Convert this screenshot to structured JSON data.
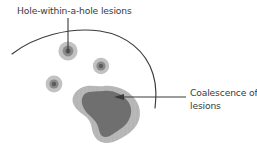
{
  "figure": {
    "background_color": "#ffffff",
    "line_color": "#3a3a3a",
    "labels": {
      "hole_within_hole": "Hole-within-a-hole lesions",
      "coalescence_line1": "Coalescence of",
      "coalescence_line2": "lesions"
    },
    "colors": {
      "lesion_outer": "#b8b8b8",
      "lesion_inner": "#7d7d7d",
      "lesion_core": "#5c5c5c",
      "blob_outer": "#b5b5b5",
      "blob_inner": "#6f6f6f",
      "stroke": "#3a3a3a",
      "text": "#3a3a3a"
    },
    "elements": {
      "bone_arc_name": "bone-cortex-arc",
      "small_lesions": [
        {
          "name": "lesion-upper-left",
          "cx": 68,
          "cy": 51,
          "r_outer": 9.5,
          "r_inner": 5.2,
          "r_core": 2.4
        },
        {
          "name": "lesion-right",
          "cx": 101,
          "cy": 66,
          "r_outer": 8.0,
          "r_inner": 4.4,
          "r_core": 2.0
        },
        {
          "name": "lesion-lower-left",
          "cx": 54,
          "cy": 84,
          "r_outer": 8.2,
          "r_inner": 4.4,
          "r_core": 2.0
        }
      ],
      "coalesced_blob": {
        "name": "coalesced-lesion-blob"
      }
    }
  }
}
